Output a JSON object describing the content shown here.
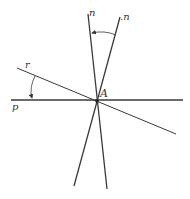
{
  "diagram": {
    "type": "geometric-lines",
    "colors": {
      "line": "#3a3a3a",
      "background": "#ffffff"
    },
    "labels": {
      "n": "n",
      "n_prime": ".n",
      "r": "r",
      "p": "p",
      "A": "A"
    },
    "lines": [
      {
        "id": "p",
        "x1": 11,
        "y1": 100,
        "x2": 183,
        "y2": 100
      },
      {
        "id": "r",
        "x1": 17,
        "y1": 68,
        "x2": 176,
        "y2": 134
      },
      {
        "id": "n",
        "x1": 88,
        "y1": 14,
        "x2": 107,
        "y2": 189
      },
      {
        "id": "n_prime",
        "x1": 120,
        "y1": 17,
        "x2": 74,
        "y2": 186
      }
    ],
    "point": {
      "id": "A",
      "x": 97,
      "y": 101
    },
    "angles": [
      {
        "between": [
          "r",
          "p"
        ],
        "direction": "r-to-p"
      },
      {
        "between": [
          "n_prime",
          "n"
        ],
        "direction": "n_prime-to-n"
      }
    ]
  }
}
